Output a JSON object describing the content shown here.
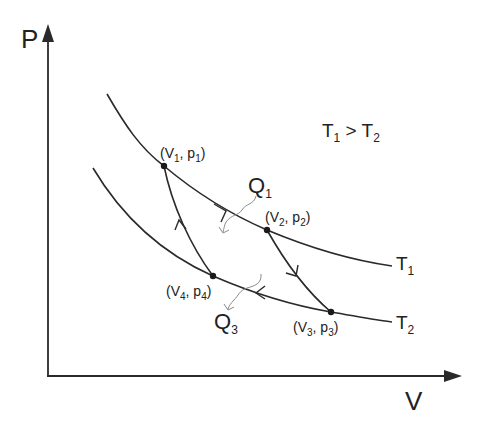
{
  "diagram": {
    "axes": {
      "y_label": "P",
      "x_label": "V"
    },
    "condition": {
      "left": "T",
      "left_sub": "1",
      "op": " > ",
      "right": "T",
      "right_sub": "2"
    },
    "isotherms": [
      {
        "label": "T",
        "sub": "1"
      },
      {
        "label": "T",
        "sub": "2"
      }
    ],
    "points": [
      {
        "v": "V",
        "v_sub": "1",
        "p": "p",
        "p_sub": "1"
      },
      {
        "v": "V",
        "v_sub": "2",
        "p": "p",
        "p_sub": "2"
      },
      {
        "v": "V",
        "v_sub": "3",
        "p": "p",
        "p_sub": "3"
      },
      {
        "v": "V",
        "v_sub": "4",
        "p": "p",
        "p_sub": "4"
      }
    ],
    "heat": [
      {
        "label": "Q",
        "sub": "1"
      },
      {
        "label": "Q",
        "sub": "3"
      }
    ],
    "colors": {
      "line": "#2a2a2a",
      "heat_arrow": "#8a8a8a",
      "background": "#ffffff"
    }
  }
}
